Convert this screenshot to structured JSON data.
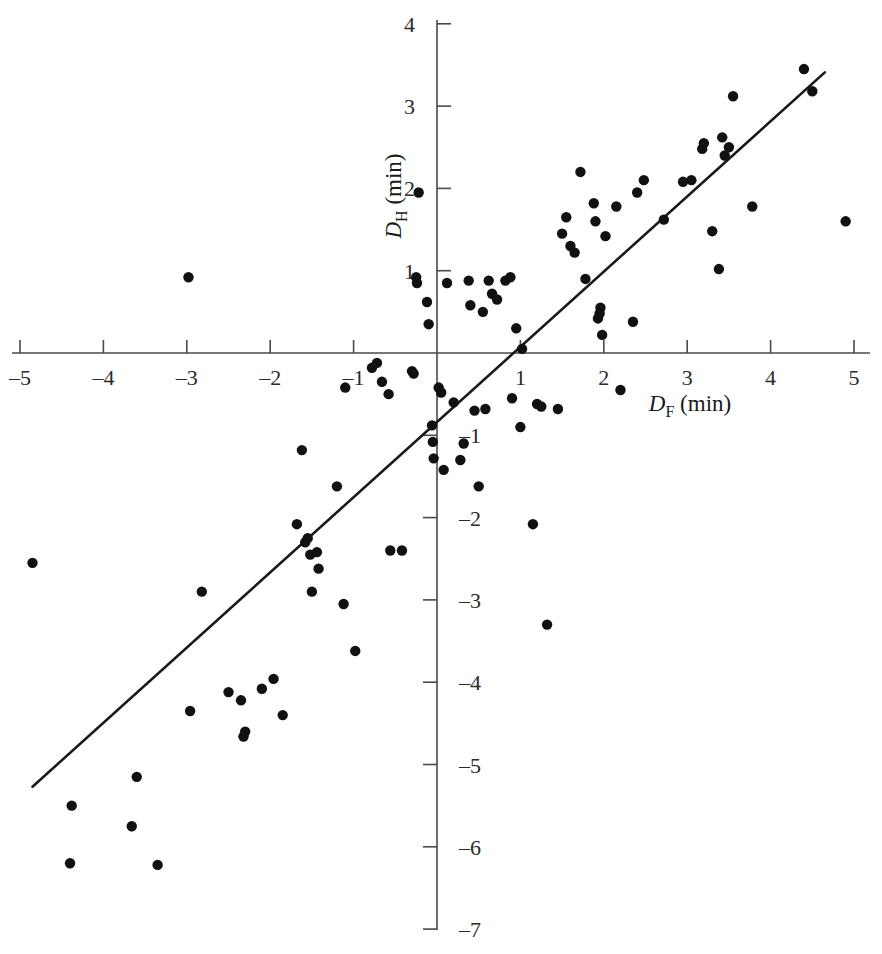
{
  "figure": {
    "kind": "scatterplot-with-regression-line",
    "background_color": "#ffffff",
    "point_color": "#111111",
    "line_color": "#1a1a1a",
    "axis_color": "#4a4a4a"
  },
  "axes": {
    "x": {
      "label_main": "D",
      "label_sub": "F",
      "label_units": "(min)",
      "label_full": "D_F (min)",
      "ticks": [
        "–5",
        "–4",
        "–3",
        "–2",
        "–1",
        "1",
        "2",
        "3",
        "4",
        "5"
      ],
      "tick_values": [
        -5,
        -4,
        -3,
        -2,
        -1,
        1,
        2,
        3,
        4,
        5
      ],
      "range": [
        -5,
        5
      ]
    },
    "y": {
      "label_main": "D",
      "label_sub": "H",
      "label_units": "(min)",
      "label_full": "D_H (min)",
      "ticks": [
        "4",
        "3",
        "2",
        "1",
        "–1",
        "–2",
        "–3",
        "–4",
        "–5",
        "–6",
        "–7"
      ],
      "tick_values": [
        4,
        3,
        2,
        1,
        -1,
        -2,
        -3,
        -4,
        -5,
        -6,
        -7
      ],
      "range": [
        -7,
        4
      ]
    }
  },
  "chart_data": {
    "type": "scatter",
    "title": "",
    "xlabel": "D_F (min)",
    "ylabel": "D_H (min)",
    "xlim": [
      -5,
      5
    ],
    "ylim": [
      -7,
      4
    ],
    "grid": false,
    "legend": false,
    "series": [
      {
        "name": "observations",
        "marker": "filled-circle",
        "color": "#111111",
        "points": [
          [
            -2.98,
            0.92
          ],
          [
            -4.85,
            -2.55
          ],
          [
            -4.38,
            -5.5
          ],
          [
            -4.4,
            -6.2
          ],
          [
            -3.6,
            -5.15
          ],
          [
            -3.66,
            -5.75
          ],
          [
            -3.35,
            -6.22
          ],
          [
            -2.96,
            -4.35
          ],
          [
            -2.82,
            -2.9
          ],
          [
            -2.5,
            -4.12
          ],
          [
            -2.35,
            -4.22
          ],
          [
            -2.3,
            -4.6
          ],
          [
            -2.32,
            -4.66
          ],
          [
            -2.1,
            -4.08
          ],
          [
            -1.96,
            -3.96
          ],
          [
            -1.85,
            -4.4
          ],
          [
            -1.68,
            -2.08
          ],
          [
            -1.62,
            -1.18
          ],
          [
            -1.58,
            -2.3
          ],
          [
            -1.52,
            -2.45
          ],
          [
            -1.55,
            -2.25
          ],
          [
            -1.5,
            -2.9
          ],
          [
            -1.44,
            -2.42
          ],
          [
            -1.42,
            -2.62
          ],
          [
            -1.2,
            -1.62
          ],
          [
            -1.12,
            -3.05
          ],
          [
            -1.1,
            -0.42
          ],
          [
            -0.98,
            -3.62
          ],
          [
            -0.78,
            -0.18
          ],
          [
            -0.72,
            -0.12
          ],
          [
            -0.66,
            -0.35
          ],
          [
            -0.58,
            -0.5
          ],
          [
            -0.56,
            -2.4
          ],
          [
            -0.42,
            -2.4
          ],
          [
            -0.3,
            -0.22
          ],
          [
            -0.28,
            -0.25
          ],
          [
            -0.25,
            0.92
          ],
          [
            -0.24,
            0.85
          ],
          [
            -0.22,
            1.95
          ],
          [
            -0.12,
            0.62
          ],
          [
            -0.1,
            0.35
          ],
          [
            -0.06,
            -0.88
          ],
          [
            -0.05,
            -1.08
          ],
          [
            -0.04,
            -1.28
          ],
          [
            0.02,
            -0.42
          ],
          [
            0.05,
            -0.48
          ],
          [
            0.08,
            -1.42
          ],
          [
            0.12,
            0.85
          ],
          [
            0.2,
            -0.6
          ],
          [
            0.28,
            -1.3
          ],
          [
            0.32,
            -1.1
          ],
          [
            0.38,
            0.88
          ],
          [
            0.4,
            0.58
          ],
          [
            0.45,
            -0.7
          ],
          [
            0.5,
            -1.62
          ],
          [
            0.55,
            0.5
          ],
          [
            0.58,
            -0.68
          ],
          [
            0.62,
            0.88
          ],
          [
            0.66,
            0.72
          ],
          [
            0.72,
            0.65
          ],
          [
            0.82,
            0.88
          ],
          [
            0.88,
            0.92
          ],
          [
            0.9,
            -0.55
          ],
          [
            0.95,
            0.3
          ],
          [
            1.0,
            -0.9
          ],
          [
            1.02,
            0.05
          ],
          [
            1.15,
            -2.08
          ],
          [
            1.2,
            -0.62
          ],
          [
            1.25,
            -0.65
          ],
          [
            1.32,
            -3.3
          ],
          [
            1.45,
            -0.68
          ],
          [
            1.5,
            1.45
          ],
          [
            1.55,
            1.65
          ],
          [
            1.6,
            1.3
          ],
          [
            1.65,
            1.22
          ],
          [
            1.72,
            2.2
          ],
          [
            1.78,
            0.9
          ],
          [
            1.88,
            1.82
          ],
          [
            1.9,
            1.6
          ],
          [
            1.93,
            0.42
          ],
          [
            1.95,
            0.48
          ],
          [
            1.96,
            0.55
          ],
          [
            1.98,
            0.22
          ],
          [
            2.02,
            1.42
          ],
          [
            2.15,
            1.78
          ],
          [
            2.2,
            -0.45
          ],
          [
            2.35,
            0.38
          ],
          [
            2.4,
            1.95
          ],
          [
            2.48,
            2.1
          ],
          [
            2.72,
            1.62
          ],
          [
            2.95,
            2.08
          ],
          [
            3.05,
            2.1
          ],
          [
            3.18,
            2.48
          ],
          [
            3.2,
            2.55
          ],
          [
            3.3,
            1.48
          ],
          [
            3.38,
            1.02
          ],
          [
            3.42,
            2.62
          ],
          [
            3.45,
            2.4
          ],
          [
            3.5,
            2.5
          ],
          [
            3.55,
            3.12
          ],
          [
            3.78,
            1.78
          ],
          [
            4.4,
            3.45
          ],
          [
            4.5,
            3.18
          ],
          [
            4.9,
            1.6
          ]
        ]
      }
    ],
    "regression_line": {
      "name": "fitted line",
      "color": "#1a1a1a",
      "x_start": -4.85,
      "y_start": -5.27,
      "x_end": 4.65,
      "y_end": 3.41,
      "slope": 0.913,
      "intercept": -0.84
    }
  }
}
